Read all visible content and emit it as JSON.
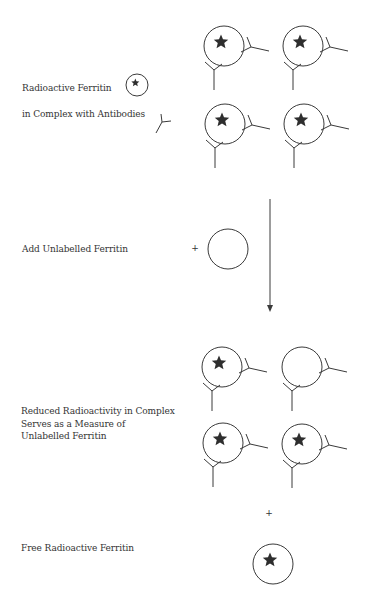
{
  "colors": {
    "stroke": "#3a3a3a",
    "star": "#2e2e2e",
    "text": "#333333",
    "background": "#ffffff"
  },
  "labels": {
    "radioactive_ferritin": "Radioactive Ferritin",
    "in_complex": "in Complex with Antibodies",
    "add_unlabelled": "Add Unlabelled Ferritin",
    "reduced_line1": "Reduced Radioactivity in Complex",
    "reduced_line2": "Serves as a Measure of",
    "reduced_line3": "Unlabelled Ferritin",
    "free_radioactive": "Free Radioactive Ferritin",
    "plus": "+"
  },
  "legend": {
    "ferritin_icon": {
      "cx": 137,
      "cy": 85,
      "r": 11,
      "star": true
    },
    "antibody_icon": {
      "jx": 162,
      "jy": 122,
      "a1": [
        161,
        114
      ],
      "a2": [
        171,
        121
      ],
      "stem": [
        156,
        133
      ]
    }
  },
  "complexes_initial": [
    {
      "cx": 224,
      "cy": 46,
      "star": true
    },
    {
      "cx": 303,
      "cy": 46,
      "star": true
    },
    {
      "cx": 225,
      "cy": 124,
      "star": true
    },
    {
      "cx": 304,
      "cy": 124,
      "star": true
    }
  ],
  "unlabelled_ferritin": {
    "cx": 228,
    "cy": 249,
    "r": 20,
    "star": false
  },
  "plus_signs": [
    {
      "x": 195,
      "y": 251
    },
    {
      "x": 269,
      "y": 516
    }
  ],
  "arrow": {
    "x": 270,
    "y1": 199,
    "y2": 312
  },
  "complexes_final": [
    {
      "cx": 222,
      "cy": 367,
      "star": true
    },
    {
      "cx": 302,
      "cy": 367,
      "star": false
    },
    {
      "cx": 223,
      "cy": 443,
      "star": true
    },
    {
      "cx": 302,
      "cy": 444,
      "star": true
    }
  ],
  "free_ferritin": {
    "cx": 273,
    "cy": 564,
    "r": 20,
    "star": true
  }
}
